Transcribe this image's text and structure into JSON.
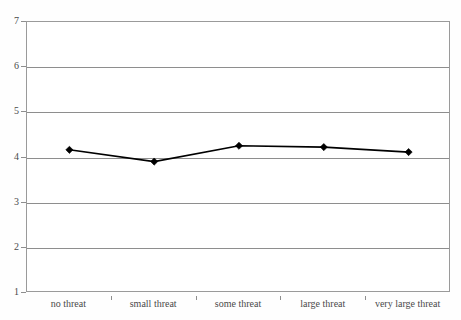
{
  "chart_data": {
    "type": "line",
    "title": "",
    "subtitle": "",
    "xlabel": "",
    "ylabel": "",
    "categories": [
      "no threat",
      "small threat",
      "some threat",
      "large threat",
      "very large threat"
    ],
    "series": [
      {
        "name": "",
        "values": [
          4.17,
          3.91,
          4.26,
          4.23,
          4.12
        ]
      }
    ],
    "ylim": [
      1,
      7
    ],
    "yticks": [
      1,
      2,
      3,
      4,
      5,
      6,
      7
    ],
    "ytick_labels": [
      "1",
      "2",
      "3",
      "4",
      "5",
      "6",
      "7"
    ],
    "grid": true,
    "grid_axis": "y",
    "legend": false,
    "legend_position": "none",
    "marker": "diamond",
    "line_color": "#000000",
    "marker_color": "#000000",
    "grid_color": "#8e8e8e",
    "axis_color": "#9a9a9a",
    "background_color": "#ffffff"
  }
}
